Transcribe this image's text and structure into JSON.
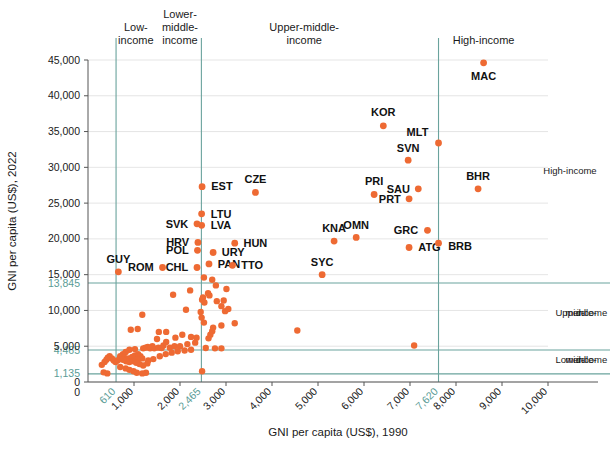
{
  "chart_data": {
    "type": "scatter",
    "title": "",
    "xlabel": "GNI per capita (US$), 1990",
    "ylabel": "GNI per capita (US$), 2022",
    "xlim": [
      0,
      10000
    ],
    "ylim": [
      0,
      45000
    ],
    "grid": true,
    "legend": "none",
    "marker_color": "#ee6a33",
    "threshold_color": "#6aa39d",
    "gridline_color": "#dedede",
    "x_ticks": [
      {
        "value": 0,
        "label": "0",
        "highlight": false
      },
      {
        "value": 610,
        "label": "610",
        "highlight": true
      },
      {
        "value": 1000,
        "label": "1,000",
        "highlight": false
      },
      {
        "value": 2000,
        "label": "2,000",
        "highlight": false
      },
      {
        "value": 2465,
        "label": "2,465",
        "highlight": true
      },
      {
        "value": 3000,
        "label": "3,000",
        "highlight": false
      },
      {
        "value": 4000,
        "label": "4,000",
        "highlight": false
      },
      {
        "value": 5000,
        "label": "5,000",
        "highlight": false
      },
      {
        "value": 6000,
        "label": "6,000",
        "highlight": false
      },
      {
        "value": 7000,
        "label": "7,000",
        "highlight": false
      },
      {
        "value": 7620,
        "label": "7,620",
        "highlight": true
      },
      {
        "value": 8000,
        "label": "8,000",
        "highlight": false
      },
      {
        "value": 9000,
        "label": "9,000",
        "highlight": false
      },
      {
        "value": 10000,
        "label": "10,000",
        "highlight": false
      }
    ],
    "y_ticks": [
      {
        "value": 0,
        "label": "0",
        "highlight": false
      },
      {
        "value": 1135,
        "label": "1,135",
        "highlight": true
      },
      {
        "value": 4465,
        "label": "4,465",
        "highlight": true
      },
      {
        "value": 5000,
        "label": "5,000",
        "highlight": false
      },
      {
        "value": 10000,
        "label": "10,000",
        "highlight": false
      },
      {
        "value": 13845,
        "label": "13,845",
        "highlight": true
      },
      {
        "value": 15000,
        "label": "15,000",
        "highlight": false
      },
      {
        "value": 20000,
        "label": "20,000",
        "highlight": false
      },
      {
        "value": 25000,
        "label": "25,000",
        "highlight": false
      },
      {
        "value": 30000,
        "label": "30,000",
        "highlight": false
      },
      {
        "value": 35000,
        "label": "35,000",
        "highlight": false
      },
      {
        "value": 40000,
        "label": "40,000",
        "highlight": false
      },
      {
        "value": 45000,
        "label": "45,000",
        "highlight": false
      }
    ],
    "x_thresholds": [
      610,
      2465,
      7620
    ],
    "y_thresholds": [
      1135,
      4465,
      13845
    ],
    "top_bands": [
      {
        "label": "Low-\nincome",
        "x": 1040
      },
      {
        "label": "Lower-\nmiddle-\nincome",
        "x": 2000
      },
      {
        "label": "Upper-middle-\nincome",
        "x": 4700
      },
      {
        "label": "High-income",
        "x": 8600
      }
    ],
    "right_bands": [
      {
        "label": "High-income",
        "y": 29000
      },
      {
        "label": "Upper-\nmiddle-\nincome",
        "y": 9200
      },
      {
        "label": "Lower-\nmiddle-\nincome",
        "y": 2600
      }
    ],
    "labeled_points": [
      {
        "code": "MAC",
        "x": 8600,
        "y": 44600,
        "lx": 8600,
        "ly": 42700,
        "anchor": "middle"
      },
      {
        "code": "KOR",
        "x": 6420,
        "y": 35800,
        "lx": 6420,
        "ly": 37700,
        "anchor": "middle"
      },
      {
        "code": "MLT",
        "x": 7620,
        "y": 33400,
        "lx": 7400,
        "ly": 34900,
        "anchor": "end"
      },
      {
        "code": "SVN",
        "x": 6960,
        "y": 31000,
        "lx": 6960,
        "ly": 32700,
        "anchor": "middle"
      },
      {
        "code": "BHR",
        "x": 8480,
        "y": 27000,
        "lx": 8480,
        "ly": 28800,
        "anchor": "middle"
      },
      {
        "code": "SAU",
        "x": 7180,
        "y": 27000,
        "lx": 7000,
        "ly": 27000,
        "anchor": "end"
      },
      {
        "code": "PRT",
        "x": 6980,
        "y": 25600,
        "lx": 6800,
        "ly": 25600,
        "anchor": "end"
      },
      {
        "code": "PRI",
        "x": 6220,
        "y": 26200,
        "lx": 6220,
        "ly": 28000,
        "anchor": "middle"
      },
      {
        "code": "CZE",
        "x": 3640,
        "y": 26500,
        "lx": 3640,
        "ly": 28300,
        "anchor": "middle"
      },
      {
        "code": "EST",
        "x": 2480,
        "y": 27300,
        "lx": 2680,
        "ly": 27300,
        "anchor": "start"
      },
      {
        "code": "LTU",
        "x": 2470,
        "y": 23500,
        "lx": 2670,
        "ly": 23500,
        "anchor": "start"
      },
      {
        "code": "LVA",
        "x": 2470,
        "y": 21900,
        "lx": 2670,
        "ly": 21900,
        "anchor": "start"
      },
      {
        "code": "SVK",
        "x": 2370,
        "y": 22100,
        "lx": 2180,
        "ly": 22100,
        "anchor": "end"
      },
      {
        "code": "GRC",
        "x": 7380,
        "y": 21200,
        "lx": 7180,
        "ly": 21200,
        "anchor": "end"
      },
      {
        "code": "OMN",
        "x": 5830,
        "y": 20200,
        "lx": 5830,
        "ly": 21900,
        "anchor": "middle"
      },
      {
        "code": "KNA",
        "x": 5350,
        "y": 19700,
        "lx": 5350,
        "ly": 21500,
        "anchor": "middle"
      },
      {
        "code": "HUN",
        "x": 3190,
        "y": 19400,
        "lx": 3380,
        "ly": 19400,
        "anchor": "start"
      },
      {
        "code": "ATG",
        "x": 6980,
        "y": 18800,
        "lx": 7180,
        "ly": 18800,
        "anchor": "start"
      },
      {
        "code": "BRB",
        "x": 7620,
        "y": 19400,
        "lx": 7830,
        "ly": 19000,
        "anchor": "start"
      },
      {
        "code": "HRV",
        "x": 2390,
        "y": 19500,
        "lx": 2200,
        "ly": 19500,
        "anchor": "end"
      },
      {
        "code": "POL",
        "x": 2380,
        "y": 18400,
        "lx": 2190,
        "ly": 18400,
        "anchor": "end"
      },
      {
        "code": "URY",
        "x": 2720,
        "y": 18100,
        "lx": 2910,
        "ly": 18100,
        "anchor": "start"
      },
      {
        "code": "PAN",
        "x": 2630,
        "y": 16500,
        "lx": 2820,
        "ly": 16400,
        "anchor": "start"
      },
      {
        "code": "TTO",
        "x": 3140,
        "y": 16300,
        "lx": 3330,
        "ly": 16300,
        "anchor": "start"
      },
      {
        "code": "CHL",
        "x": 2370,
        "y": 16000,
        "lx": 2180,
        "ly": 16000,
        "anchor": "end"
      },
      {
        "code": "ROM",
        "x": 1620,
        "y": 16000,
        "lx": 1430,
        "ly": 16000,
        "anchor": "end"
      },
      {
        "code": "GUY",
        "x": 660,
        "y": 15400,
        "lx": 660,
        "ly": 17200,
        "anchor": "middle"
      },
      {
        "code": "SYC",
        "x": 5090,
        "y": 15000,
        "lx": 5090,
        "ly": 16800,
        "anchor": "middle"
      }
    ],
    "unlabeled_points": [
      {
        "x": 2520,
        "y": 14600
      },
      {
        "x": 2700,
        "y": 14300
      },
      {
        "x": 2780,
        "y": 13500
      },
      {
        "x": 3010,
        "y": 13000
      },
      {
        "x": 2610,
        "y": 12400
      },
      {
        "x": 2640,
        "y": 12100
      },
      {
        "x": 2500,
        "y": 11800
      },
      {
        "x": 2480,
        "y": 11500
      },
      {
        "x": 2530,
        "y": 11100
      },
      {
        "x": 2800,
        "y": 11300
      },
      {
        "x": 2950,
        "y": 11400
      },
      {
        "x": 1850,
        "y": 12200
      },
      {
        "x": 2220,
        "y": 12800
      },
      {
        "x": 2130,
        "y": 10100
      },
      {
        "x": 1180,
        "y": 9400
      },
      {
        "x": 2450,
        "y": 9800
      },
      {
        "x": 2470,
        "y": 9000
      },
      {
        "x": 2520,
        "y": 8300
      },
      {
        "x": 3190,
        "y": 8200
      },
      {
        "x": 2980,
        "y": 9900
      },
      {
        "x": 4550,
        "y": 7200
      },
      {
        "x": 7090,
        "y": 5100
      },
      {
        "x": 930,
        "y": 7300
      },
      {
        "x": 1080,
        "y": 7400
      },
      {
        "x": 1540,
        "y": 7000
      },
      {
        "x": 1700,
        "y": 7000
      },
      {
        "x": 1900,
        "y": 6200
      },
      {
        "x": 2050,
        "y": 6600
      },
      {
        "x": 2240,
        "y": 6300
      },
      {
        "x": 2360,
        "y": 6200
      },
      {
        "x": 2330,
        "y": 5500
      },
      {
        "x": 2160,
        "y": 5300
      },
      {
        "x": 1640,
        "y": 5100
      },
      {
        "x": 1400,
        "y": 5000
      },
      {
        "x": 1300,
        "y": 4900
      },
      {
        "x": 1250,
        "y": 4800
      },
      {
        "x": 1200,
        "y": 4700
      },
      {
        "x": 1350,
        "y": 4700
      },
      {
        "x": 1440,
        "y": 4700
      },
      {
        "x": 1530,
        "y": 4800
      },
      {
        "x": 1600,
        "y": 4750
      },
      {
        "x": 1780,
        "y": 4800
      },
      {
        "x": 1880,
        "y": 5000
      },
      {
        "x": 2000,
        "y": 5000
      },
      {
        "x": 2560,
        "y": 4750
      },
      {
        "x": 2760,
        "y": 4700
      },
      {
        "x": 2900,
        "y": 4700
      },
      {
        "x": 1020,
        "y": 4600
      },
      {
        "x": 900,
        "y": 4500
      },
      {
        "x": 820,
        "y": 4200
      },
      {
        "x": 760,
        "y": 3900
      },
      {
        "x": 700,
        "y": 3600
      },
      {
        "x": 790,
        "y": 3400
      },
      {
        "x": 880,
        "y": 3300
      },
      {
        "x": 960,
        "y": 3500
      },
      {
        "x": 1020,
        "y": 3700
      },
      {
        "x": 1090,
        "y": 3900
      },
      {
        "x": 1140,
        "y": 3600
      },
      {
        "x": 1180,
        "y": 3300
      },
      {
        "x": 1080,
        "y": 3100
      },
      {
        "x": 990,
        "y": 2900
      },
      {
        "x": 900,
        "y": 2800
      },
      {
        "x": 830,
        "y": 2900
      },
      {
        "x": 760,
        "y": 3100
      },
      {
        "x": 690,
        "y": 3200
      },
      {
        "x": 640,
        "y": 3000
      },
      {
        "x": 600,
        "y": 2800
      },
      {
        "x": 560,
        "y": 3000
      },
      {
        "x": 520,
        "y": 3300
      },
      {
        "x": 470,
        "y": 3600
      },
      {
        "x": 430,
        "y": 3400
      },
      {
        "x": 400,
        "y": 3100
      },
      {
        "x": 360,
        "y": 2800
      },
      {
        "x": 300,
        "y": 2400
      },
      {
        "x": 1290,
        "y": 2600
      },
      {
        "x": 1200,
        "y": 2300
      },
      {
        "x": 1120,
        "y": 2500
      },
      {
        "x": 1050,
        "y": 2700
      },
      {
        "x": 1310,
        "y": 3000
      },
      {
        "x": 1420,
        "y": 3200
      },
      {
        "x": 1560,
        "y": 3600
      },
      {
        "x": 1690,
        "y": 3900
      },
      {
        "x": 1820,
        "y": 4100
      },
      {
        "x": 1950,
        "y": 4300
      },
      {
        "x": 2100,
        "y": 4400
      },
      {
        "x": 2240,
        "y": 4500
      },
      {
        "x": 1700,
        "y": 5600
      },
      {
        "x": 1500,
        "y": 6000
      },
      {
        "x": 2620,
        "y": 6100
      },
      {
        "x": 2660,
        "y": 6600
      },
      {
        "x": 2700,
        "y": 7100
      },
      {
        "x": 2720,
        "y": 7600
      },
      {
        "x": 2900,
        "y": 7900
      },
      {
        "x": 3050,
        "y": 10200
      },
      {
        "x": 2900,
        "y": 10600
      },
      {
        "x": 2480,
        "y": 1500
      },
      {
        "x": 1260,
        "y": 1300
      },
      {
        "x": 1180,
        "y": 1200
      },
      {
        "x": 1060,
        "y": 1300
      },
      {
        "x": 990,
        "y": 1500
      },
      {
        "x": 900,
        "y": 1700
      },
      {
        "x": 820,
        "y": 1900
      },
      {
        "x": 700,
        "y": 2100
      },
      {
        "x": 420,
        "y": 1200
      },
      {
        "x": 340,
        "y": 1350
      }
    ]
  }
}
